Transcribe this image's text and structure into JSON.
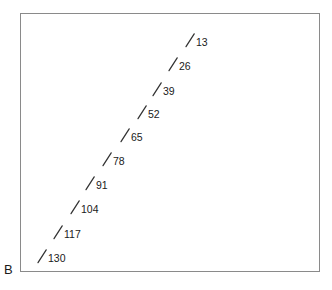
{
  "figure": {
    "panel_label": "B",
    "background_color": "#ffffff",
    "frame_color": "#8a8a8a",
    "marker_color": "#333333",
    "text_color": "#1a1a1a"
  },
  "chart_data": {
    "type": "scatter",
    "title": "",
    "subtitle": "",
    "xlabel": "",
    "ylabel": "",
    "panel": "B",
    "grid": false,
    "legend": null,
    "axis_ticks_visible": false,
    "axis_tick_labels_visible": false,
    "marker_style": "slash-tick",
    "xlim": [
      0,
      332
    ],
    "ylim": [
      0,
      290
    ],
    "point_labels": [
      "13",
      "26",
      "39",
      "52",
      "65",
      "78",
      "91",
      "104",
      "117",
      "130"
    ],
    "points": [
      {
        "label": "13",
        "x": 185,
        "y": 33
      },
      {
        "label": "26",
        "x": 168,
        "y": 57
      },
      {
        "label": "39",
        "x": 152,
        "y": 82
      },
      {
        "label": "52",
        "x": 137,
        "y": 105
      },
      {
        "label": "65",
        "x": 120,
        "y": 128
      },
      {
        "label": "78",
        "x": 102,
        "y": 152
      },
      {
        "label": "91",
        "x": 85,
        "y": 176
      },
      {
        "label": "104",
        "x": 70,
        "y": 200
      },
      {
        "label": "117",
        "x": 53,
        "y": 225
      },
      {
        "label": "130",
        "x": 37,
        "y": 249
      }
    ]
  }
}
